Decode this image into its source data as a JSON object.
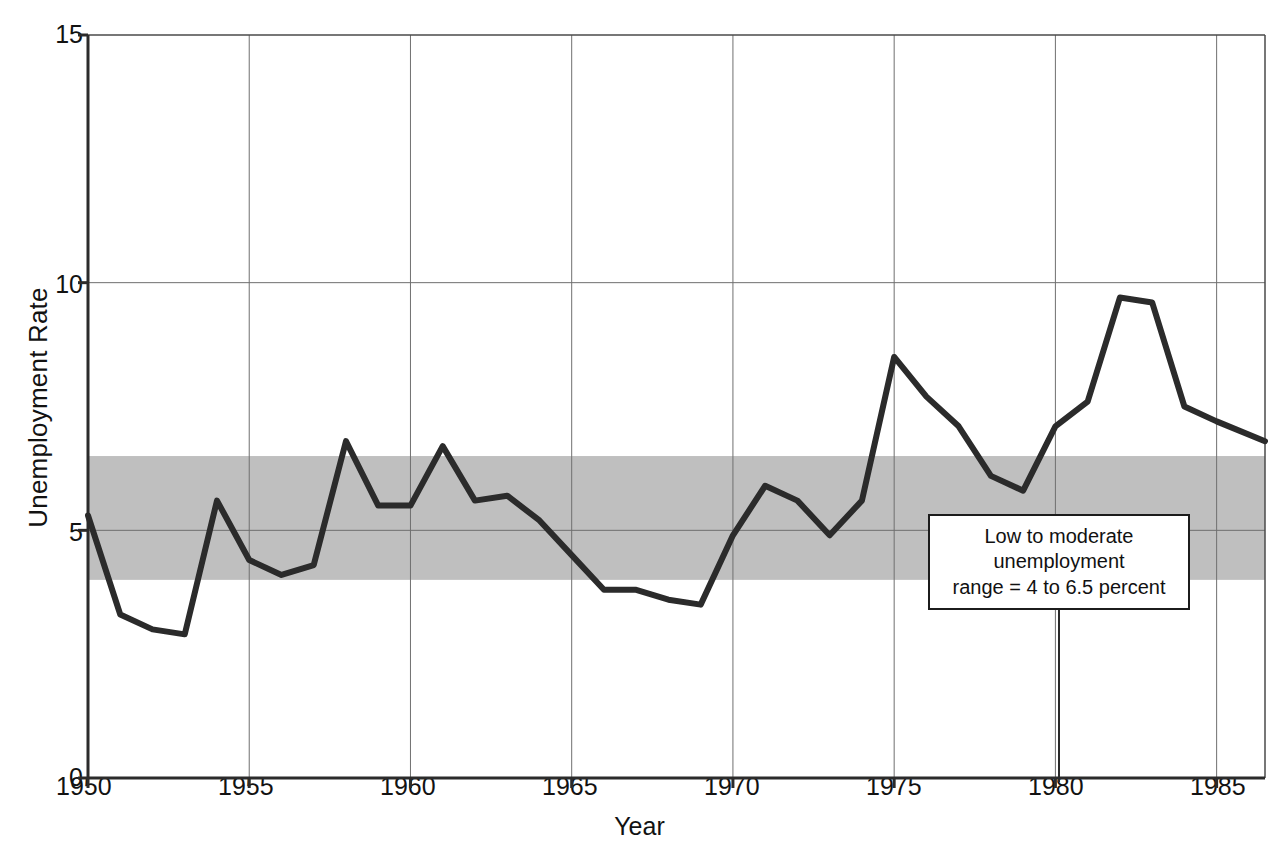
{
  "chart_data": {
    "type": "line",
    "title": "",
    "xlabel": "Year",
    "ylabel": "Unemployment Rate",
    "xlim": [
      1950,
      1986.5
    ],
    "ylim": [
      0,
      15
    ],
    "yticks": [
      0,
      5,
      10,
      15
    ],
    "xticks": [
      1950,
      1955,
      1960,
      1965,
      1970,
      1975,
      1980,
      1985
    ],
    "grid": true,
    "legend": "none",
    "series": [
      {
        "name": "Unemployment Rate",
        "color": "#2b2b2b",
        "x": [
          1950,
          1951,
          1952,
          1953,
          1954,
          1955,
          1956,
          1957,
          1958,
          1959,
          1960,
          1961,
          1962,
          1963,
          1964,
          1965,
          1966,
          1967,
          1968,
          1969,
          1970,
          1971,
          1972,
          1973,
          1974,
          1975,
          1976,
          1977,
          1978,
          1979,
          1980,
          1981,
          1982,
          1983,
          1984,
          1985,
          1986.5
        ],
        "values": [
          5.3,
          3.3,
          3.0,
          2.9,
          5.6,
          4.4,
          4.1,
          4.3,
          6.8,
          5.5,
          5.5,
          6.7,
          5.6,
          5.7,
          5.2,
          4.5,
          3.8,
          3.8,
          3.6,
          3.5,
          4.9,
          5.9,
          5.6,
          4.9,
          5.6,
          8.5,
          7.7,
          7.1,
          6.1,
          5.8,
          7.1,
          7.6,
          9.7,
          9.6,
          7.5,
          7.2,
          6.8
        ]
      }
    ],
    "band": {
      "label": "Low to moderate unemployment range",
      "ymin": 4,
      "ymax": 6.5,
      "color": "#b4b4b4"
    },
    "annotation": {
      "lines": [
        "Low to moderate",
        "unemployment",
        "range = 4 to 6.5 percent"
      ],
      "pointer_x": 1059,
      "pointer_from_y": 610,
      "pointer_to_y": 782
    }
  },
  "axes": {
    "y_tick_labels": [
      "15",
      "10",
      "5",
      "0"
    ],
    "x_tick_labels": [
      "1950",
      "1955",
      "1960",
      "1965",
      "1970",
      "1975",
      "1980",
      "1985"
    ],
    "y_axis_title": "Unemployment Rate",
    "x_axis_title": "Year"
  }
}
